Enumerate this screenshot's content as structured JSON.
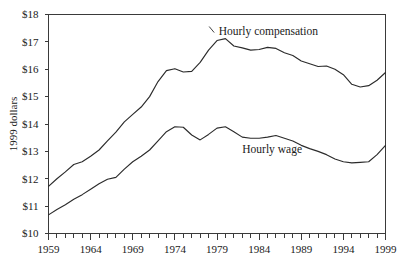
{
  "chart_data": {
    "type": "line",
    "title": "",
    "xlabel": "",
    "ylabel": "1999 dollars",
    "xlim": [
      1959,
      1999
    ],
    "ylim": [
      10,
      18
    ],
    "grid": false,
    "legend_position": "inline-annotation",
    "y_ticks": [
      "$10",
      "$11",
      "$12",
      "$13",
      "$14",
      "$15",
      "$16",
      "$17",
      "$18"
    ],
    "y_tick_values": [
      10,
      11,
      12,
      13,
      14,
      15,
      16,
      17,
      18
    ],
    "x_ticks": [
      "1959",
      "1964",
      "1969",
      "1974",
      "1979",
      "1984",
      "1989",
      "1994",
      "1999"
    ],
    "x_tick_values": [
      1959,
      1964,
      1969,
      1974,
      1979,
      1984,
      1989,
      1994,
      1999
    ],
    "x_minor_tick_interval": 1,
    "x": [
      1959,
      1960,
      1961,
      1962,
      1963,
      1964,
      1965,
      1966,
      1967,
      1968,
      1969,
      1970,
      1971,
      1972,
      1973,
      1974,
      1975,
      1976,
      1977,
      1978,
      1979,
      1980,
      1981,
      1982,
      1983,
      1984,
      1985,
      1986,
      1987,
      1988,
      1989,
      1990,
      1991,
      1992,
      1993,
      1994,
      1995,
      1996,
      1997,
      1998,
      1999
    ],
    "series": [
      {
        "name": "Hourly compensation",
        "color": "#2b2b2b",
        "label_x": 1979.2,
        "label_y": 17.25,
        "values": [
          11.72,
          12.0,
          12.25,
          12.52,
          12.62,
          12.82,
          13.05,
          13.38,
          13.7,
          14.08,
          14.35,
          14.62,
          15.0,
          15.55,
          15.95,
          16.02,
          15.9,
          15.92,
          16.25,
          16.7,
          17.05,
          17.12,
          16.85,
          16.78,
          16.7,
          16.72,
          16.8,
          16.76,
          16.6,
          16.5,
          16.3,
          16.2,
          16.1,
          16.12,
          16.0,
          15.8,
          15.45,
          15.35,
          15.4,
          15.6,
          15.88
        ]
      },
      {
        "name": "Hourly wage",
        "color": "#2b2b2b",
        "label_x": 1982.0,
        "label_y": 12.95,
        "values": [
          10.68,
          10.88,
          11.05,
          11.25,
          11.42,
          11.62,
          11.82,
          11.98,
          12.05,
          12.35,
          12.62,
          12.82,
          13.05,
          13.38,
          13.72,
          13.9,
          13.88,
          13.6,
          13.42,
          13.62,
          13.85,
          13.9,
          13.72,
          13.52,
          13.48,
          13.48,
          13.52,
          13.58,
          13.48,
          13.38,
          13.22,
          13.1,
          13.0,
          12.88,
          12.72,
          12.62,
          12.58,
          12.6,
          12.62,
          12.88,
          13.22
        ]
      }
    ]
  }
}
